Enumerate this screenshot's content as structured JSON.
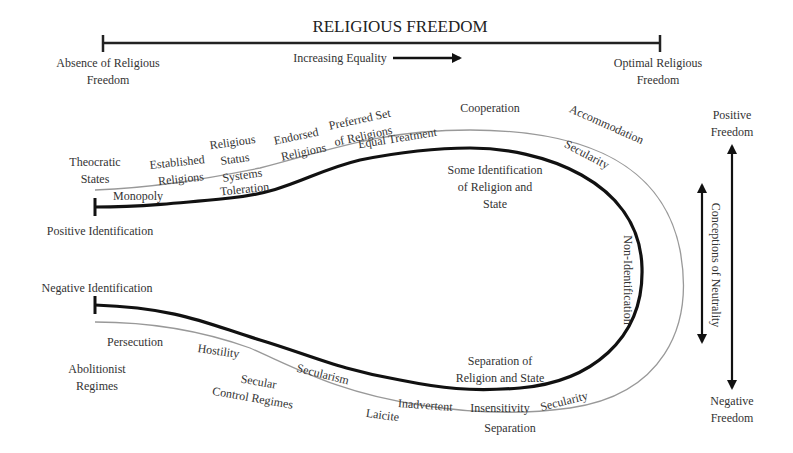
{
  "title": "RELIGIOUS FREEDOM",
  "top_axis": {
    "left_label": [
      "Absence of Religious",
      "Freedom"
    ],
    "right_label": [
      "Optimal Religious",
      "Freedom"
    ],
    "direction_label": "Increasing Equality"
  },
  "outer_track": {
    "upper": [
      "Theocratic States",
      "Established Religions",
      "Religious Status Systems",
      "Endorsed Religions",
      "Preferred Set of Religions",
      "Cooperation",
      "Accommodation"
    ],
    "lower": [
      "Abolitionist Regimes",
      "Secular Control Regimes",
      "Laicite",
      "Separation"
    ]
  },
  "inner_track": {
    "upper": [
      "Monopoly",
      "Toleration",
      "Equal Treatment",
      "Secularity"
    ],
    "right": "Non-Identification",
    "lower": [
      "Persecution",
      "Hostility",
      "Secularism",
      "Inadvertent",
      "Insensitivity",
      "Secularity"
    ]
  },
  "endpoints": {
    "top": "Positive Identification",
    "bottom": "Negative Identification"
  },
  "inner_regions": {
    "upper": [
      "Some Identification",
      "of Religion and",
      "State"
    ],
    "lower": [
      "Separation of",
      "Religion and State"
    ]
  },
  "right_axis": {
    "top_label": [
      "Positive",
      "Freedom"
    ],
    "bottom_label": [
      "Negative",
      "Freedom"
    ],
    "neutrality_label": "Conceptions of Neutrality"
  }
}
